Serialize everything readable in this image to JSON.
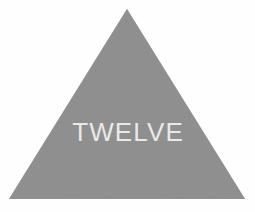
{
  "figure": {
    "name": "gray-triangle-with-label",
    "background_color": "#fefefe",
    "shape": {
      "kind": "triangle",
      "fill_color": "#808080",
      "apex": {
        "x": 127,
        "y": 9
      },
      "base_left": {
        "x": 9,
        "y": 199
      },
      "base_right": {
        "x": 245,
        "y": 199
      }
    },
    "label": {
      "text": "TWELVE",
      "color": "#e9e9e9"
    }
  }
}
